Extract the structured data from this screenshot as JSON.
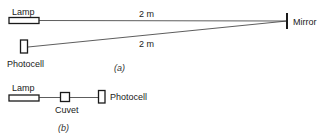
{
  "diagram": {
    "panel_a": {
      "caption": "(a)",
      "lamp_label": "Lamp",
      "photocell_label": "Photocell",
      "mirror_label": "Mirror",
      "upper_distance": "2 m",
      "lower_distance": "2 m"
    },
    "panel_b": {
      "caption": "(b)",
      "lamp_label": "Lamp",
      "cuvet_label": "Cuvet",
      "photocell_label": "Photocell"
    },
    "colors": {
      "stroke": "#1a1a1a",
      "background": "#ffffff"
    }
  }
}
